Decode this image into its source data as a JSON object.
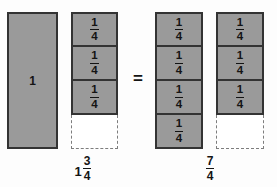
{
  "diagram": {
    "title_text": "",
    "background_color": "#fdfdfd",
    "fill_color": "#9a9a9a",
    "border_color": "#333333",
    "dashed_color": "#7d7d7d",
    "text_color": "#141414",
    "relation_symbol": "=",
    "columns": [
      {
        "id": "whole-unit",
        "kind": "whole",
        "label": "1",
        "cells": [
          {
            "state": "filled",
            "label": "1"
          }
        ]
      },
      {
        "id": "left-quarters",
        "kind": "quarters",
        "cells": [
          {
            "state": "filled",
            "numerator": "1",
            "denominator": "4"
          },
          {
            "state": "filled",
            "numerator": "1",
            "denominator": "4"
          },
          {
            "state": "filled",
            "numerator": "1",
            "denominator": "4"
          },
          {
            "state": "empty",
            "numerator": "",
            "denominator": ""
          }
        ]
      },
      {
        "id": "right-quarters-a",
        "kind": "quarters",
        "cells": [
          {
            "state": "filled",
            "numerator": "1",
            "denominator": "4"
          },
          {
            "state": "filled",
            "numerator": "1",
            "denominator": "4"
          },
          {
            "state": "filled",
            "numerator": "1",
            "denominator": "4"
          },
          {
            "state": "filled",
            "numerator": "1",
            "denominator": "4"
          }
        ]
      },
      {
        "id": "right-quarters-b",
        "kind": "quarters",
        "cells": [
          {
            "state": "filled",
            "numerator": "1",
            "denominator": "4"
          },
          {
            "state": "filled",
            "numerator": "1",
            "denominator": "4"
          },
          {
            "state": "filled",
            "numerator": "1",
            "denominator": "4"
          },
          {
            "state": "empty",
            "numerator": "",
            "denominator": ""
          }
        ]
      }
    ],
    "labels": {
      "left": {
        "whole_part": "1",
        "numerator": "3",
        "denominator": "4",
        "full_text": "1 3/4"
      },
      "right": {
        "whole_part": "",
        "numerator": "7",
        "denominator": "4",
        "full_text": "7/4"
      }
    }
  }
}
